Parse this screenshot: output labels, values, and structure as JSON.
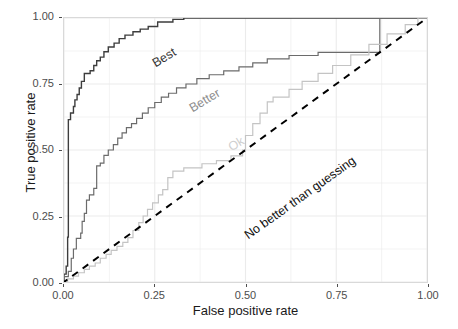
{
  "chart_data": {
    "type": "line",
    "title": "",
    "xlabel": "False positive rate",
    "ylabel": "True positive rate",
    "xlim": [
      0.0,
      1.0
    ],
    "ylim": [
      0.0,
      1.0
    ],
    "xticks": [
      "0.00",
      "0.25",
      "0.50",
      "0.75",
      "1.00"
    ],
    "yticks": [
      "0.00",
      "0.25",
      "0.50",
      "0.75",
      "1.00"
    ],
    "xtick_values": [
      0.0,
      0.25,
      0.5,
      0.75,
      1.0
    ],
    "ytick_values": [
      0.0,
      0.25,
      0.5,
      0.75,
      1.0
    ],
    "grid": true,
    "legend": "inline-curve-labels",
    "annotations": [
      {
        "text": "Best",
        "x": 0.09,
        "y": 0.92,
        "rotation": -31,
        "color": "#333333"
      },
      {
        "text": "Better",
        "x": 0.2,
        "y": 0.76,
        "rotation": -31,
        "color": "#8c8c8c"
      },
      {
        "text": "Ok",
        "x": 0.3,
        "y": 0.62,
        "rotation": -31,
        "color": "#cfcfcf"
      },
      {
        "text": "No better than guessing",
        "x": 0.35,
        "y": 0.28,
        "rotation": -35.5,
        "color": "#111111"
      }
    ],
    "series": [
      {
        "name": "Best",
        "color": "#3d3d3d",
        "linestyle": "step",
        "width": 1.4,
        "points": [
          [
            0.0,
            0.0
          ],
          [
            0.0,
            0.03
          ],
          [
            0.006,
            0.03
          ],
          [
            0.006,
            0.06
          ],
          [
            0.01,
            0.06
          ],
          [
            0.01,
            0.17
          ],
          [
            0.012,
            0.17
          ],
          [
            0.012,
            0.615
          ],
          [
            0.018,
            0.615
          ],
          [
            0.018,
            0.64
          ],
          [
            0.026,
            0.64
          ],
          [
            0.026,
            0.665
          ],
          [
            0.03,
            0.665
          ],
          [
            0.03,
            0.69
          ],
          [
            0.036,
            0.69
          ],
          [
            0.036,
            0.71
          ],
          [
            0.042,
            0.71
          ],
          [
            0.042,
            0.735
          ],
          [
            0.048,
            0.735
          ],
          [
            0.048,
            0.76
          ],
          [
            0.056,
            0.76
          ],
          [
            0.056,
            0.79
          ],
          [
            0.072,
            0.79
          ],
          [
            0.072,
            0.8
          ],
          [
            0.082,
            0.8
          ],
          [
            0.082,
            0.82
          ],
          [
            0.09,
            0.82
          ],
          [
            0.09,
            0.838
          ],
          [
            0.1,
            0.838
          ],
          [
            0.1,
            0.852
          ],
          [
            0.11,
            0.852
          ],
          [
            0.11,
            0.872
          ],
          [
            0.122,
            0.872
          ],
          [
            0.122,
            0.89
          ],
          [
            0.138,
            0.89
          ],
          [
            0.138,
            0.905
          ],
          [
            0.152,
            0.905
          ],
          [
            0.152,
            0.922
          ],
          [
            0.168,
            0.922
          ],
          [
            0.168,
            0.935
          ],
          [
            0.19,
            0.935
          ],
          [
            0.19,
            0.948
          ],
          [
            0.21,
            0.948
          ],
          [
            0.21,
            0.958
          ],
          [
            0.232,
            0.958
          ],
          [
            0.232,
            0.968
          ],
          [
            0.258,
            0.968
          ],
          [
            0.258,
            0.985
          ],
          [
            0.3,
            0.985
          ],
          [
            0.3,
            0.995
          ],
          [
            0.33,
            0.995
          ],
          [
            0.33,
            1.0
          ],
          [
            1.0,
            1.0
          ]
        ]
      },
      {
        "name": "Better",
        "color": "#6b6b6b",
        "linestyle": "step",
        "width": 1.2,
        "points": [
          [
            0.0,
            0.0
          ],
          [
            0.0,
            0.02
          ],
          [
            0.012,
            0.02
          ],
          [
            0.012,
            0.04
          ],
          [
            0.02,
            0.04
          ],
          [
            0.02,
            0.09
          ],
          [
            0.026,
            0.09
          ],
          [
            0.026,
            0.125
          ],
          [
            0.034,
            0.125
          ],
          [
            0.034,
            0.165
          ],
          [
            0.046,
            0.165
          ],
          [
            0.046,
            0.185
          ],
          [
            0.05,
            0.185
          ],
          [
            0.05,
            0.23
          ],
          [
            0.056,
            0.23
          ],
          [
            0.056,
            0.26
          ],
          [
            0.062,
            0.26
          ],
          [
            0.062,
            0.31
          ],
          [
            0.07,
            0.31
          ],
          [
            0.07,
            0.33
          ],
          [
            0.082,
            0.33
          ],
          [
            0.082,
            0.355
          ],
          [
            0.09,
            0.355
          ],
          [
            0.09,
            0.44
          ],
          [
            0.1,
            0.44
          ],
          [
            0.1,
            0.45
          ],
          [
            0.11,
            0.45
          ],
          [
            0.11,
            0.48
          ],
          [
            0.122,
            0.48
          ],
          [
            0.122,
            0.5
          ],
          [
            0.136,
            0.5
          ],
          [
            0.136,
            0.52
          ],
          [
            0.148,
            0.52
          ],
          [
            0.148,
            0.545
          ],
          [
            0.16,
            0.545
          ],
          [
            0.16,
            0.565
          ],
          [
            0.172,
            0.565
          ],
          [
            0.172,
            0.585
          ],
          [
            0.186,
            0.585
          ],
          [
            0.186,
            0.6
          ],
          [
            0.2,
            0.6
          ],
          [
            0.2,
            0.62
          ],
          [
            0.216,
            0.62
          ],
          [
            0.216,
            0.64
          ],
          [
            0.232,
            0.64
          ],
          [
            0.232,
            0.66
          ],
          [
            0.25,
            0.66
          ],
          [
            0.25,
            0.68
          ],
          [
            0.268,
            0.68
          ],
          [
            0.268,
            0.7
          ],
          [
            0.288,
            0.7
          ],
          [
            0.288,
            0.715
          ],
          [
            0.31,
            0.715
          ],
          [
            0.31,
            0.735
          ],
          [
            0.336,
            0.735
          ],
          [
            0.336,
            0.75
          ],
          [
            0.366,
            0.75
          ],
          [
            0.366,
            0.77
          ],
          [
            0.4,
            0.77
          ],
          [
            0.4,
            0.785
          ],
          [
            0.44,
            0.785
          ],
          [
            0.44,
            0.8
          ],
          [
            0.482,
            0.8
          ],
          [
            0.482,
            0.815
          ],
          [
            0.52,
            0.815
          ],
          [
            0.52,
            0.83
          ],
          [
            0.56,
            0.83
          ],
          [
            0.56,
            0.845
          ],
          [
            0.62,
            0.845
          ],
          [
            0.62,
            0.858
          ],
          [
            0.7,
            0.858
          ],
          [
            0.7,
            0.87
          ],
          [
            0.87,
            0.87
          ],
          [
            0.87,
            1.0
          ],
          [
            1.0,
            1.0
          ]
        ]
      },
      {
        "name": "Ok",
        "color": "#c4c4c4",
        "linestyle": "step",
        "width": 1.2,
        "points": [
          [
            0.0,
            0.0
          ],
          [
            0.01,
            0.0
          ],
          [
            0.01,
            0.012
          ],
          [
            0.026,
            0.012
          ],
          [
            0.026,
            0.022
          ],
          [
            0.04,
            0.022
          ],
          [
            0.04,
            0.035
          ],
          [
            0.056,
            0.035
          ],
          [
            0.056,
            0.048
          ],
          [
            0.07,
            0.048
          ],
          [
            0.07,
            0.06
          ],
          [
            0.086,
            0.06
          ],
          [
            0.086,
            0.072
          ],
          [
            0.1,
            0.072
          ],
          [
            0.1,
            0.09
          ],
          [
            0.116,
            0.09
          ],
          [
            0.116,
            0.105
          ],
          [
            0.13,
            0.105
          ],
          [
            0.13,
            0.12
          ],
          [
            0.146,
            0.12
          ],
          [
            0.146,
            0.135
          ],
          [
            0.162,
            0.135
          ],
          [
            0.162,
            0.15
          ],
          [
            0.176,
            0.15
          ],
          [
            0.176,
            0.168
          ],
          [
            0.19,
            0.168
          ],
          [
            0.19,
            0.195
          ],
          [
            0.206,
            0.195
          ],
          [
            0.206,
            0.225
          ],
          [
            0.218,
            0.225
          ],
          [
            0.218,
            0.25
          ],
          [
            0.23,
            0.25
          ],
          [
            0.23,
            0.275
          ],
          [
            0.244,
            0.275
          ],
          [
            0.244,
            0.3
          ],
          [
            0.26,
            0.3
          ],
          [
            0.26,
            0.33
          ],
          [
            0.272,
            0.33
          ],
          [
            0.272,
            0.35
          ],
          [
            0.286,
            0.35
          ],
          [
            0.286,
            0.395
          ],
          [
            0.3,
            0.395
          ],
          [
            0.3,
            0.42
          ],
          [
            0.33,
            0.42
          ],
          [
            0.33,
            0.432
          ],
          [
            0.38,
            0.432
          ],
          [
            0.38,
            0.448
          ],
          [
            0.42,
            0.448
          ],
          [
            0.42,
            0.46
          ],
          [
            0.46,
            0.46
          ],
          [
            0.46,
            0.478
          ],
          [
            0.492,
            0.478
          ],
          [
            0.492,
            0.5
          ],
          [
            0.5,
            0.5
          ],
          [
            0.5,
            0.555
          ],
          [
            0.52,
            0.555
          ],
          [
            0.52,
            0.6
          ],
          [
            0.54,
            0.6
          ],
          [
            0.54,
            0.64
          ],
          [
            0.56,
            0.64
          ],
          [
            0.56,
            0.682
          ],
          [
            0.576,
            0.682
          ],
          [
            0.576,
            0.7
          ],
          [
            0.62,
            0.7
          ],
          [
            0.62,
            0.73
          ],
          [
            0.656,
            0.73
          ],
          [
            0.656,
            0.76
          ],
          [
            0.7,
            0.76
          ],
          [
            0.7,
            0.79
          ],
          [
            0.74,
            0.79
          ],
          [
            0.74,
            0.82
          ],
          [
            0.79,
            0.82
          ],
          [
            0.79,
            0.86
          ],
          [
            0.84,
            0.86
          ],
          [
            0.84,
            0.9
          ],
          [
            0.89,
            0.9
          ],
          [
            0.89,
            0.94
          ],
          [
            0.94,
            0.94
          ],
          [
            0.94,
            0.975
          ],
          [
            0.975,
            0.975
          ],
          [
            0.975,
            1.0
          ],
          [
            1.0,
            1.0
          ]
        ]
      },
      {
        "name": "No better than guessing",
        "color": "#000000",
        "linestyle": "dashed",
        "width": 2.0,
        "points": [
          [
            -0.035,
            -0.035
          ],
          [
            1.02,
            1.02
          ]
        ]
      }
    ]
  },
  "axes": {
    "x": {
      "title": "False positive rate",
      "ticks": [
        {
          "label": "0.00",
          "value": 0.0
        },
        {
          "label": "0.25",
          "value": 0.25
        },
        {
          "label": "0.50",
          "value": 0.5
        },
        {
          "label": "0.75",
          "value": 0.75
        },
        {
          "label": "1.00",
          "value": 1.0
        }
      ]
    },
    "y": {
      "title": "True positive rate",
      "ticks": [
        {
          "label": "0.00",
          "value": 0.0
        },
        {
          "label": "0.25",
          "value": 0.25
        },
        {
          "label": "0.50",
          "value": 0.5
        },
        {
          "label": "0.75",
          "value": 0.75
        },
        {
          "label": "1.00",
          "value": 1.0
        }
      ]
    }
  },
  "labels": {
    "best": "Best",
    "better": "Better",
    "ok": "Ok",
    "guessing": "No better than guessing"
  },
  "colors": {
    "panel_border": "#d9d9d9",
    "grid": "#ebebeb",
    "best": "#3d3d3d",
    "better": "#6b6b6b",
    "ok": "#c4c4c4",
    "diagonal": "#000000",
    "text": "#1a1a1a",
    "tick_text": "#4d4d4d"
  }
}
